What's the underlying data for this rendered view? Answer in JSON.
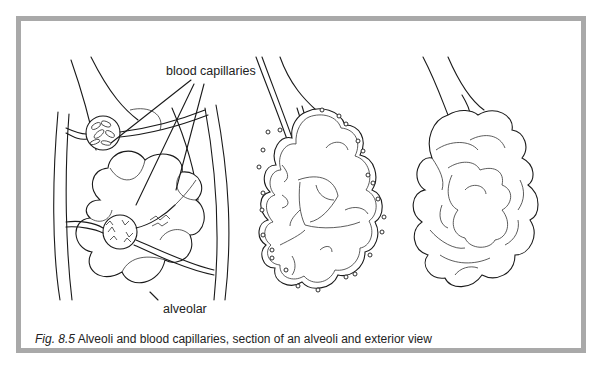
{
  "figure": {
    "number": "Fig. 8.5",
    "caption": "Alveoli and blood capillaries, section of an alveoli and exterior view"
  },
  "labels": {
    "blood_capillaries": "blood capillaries",
    "alveolar": "alveolar"
  },
  "panels": [
    {
      "id": "capillary-network",
      "description": "Alveolar sac wrapped in blood capillaries with leader lines"
    },
    {
      "id": "section-view",
      "description": "Cross-section of an alveolar sac showing internal chambers and surface capillaries"
    },
    {
      "id": "exterior-view",
      "description": "Exterior view of a cluster of alveoli on a bronchiole"
    }
  ],
  "colors": {
    "frame_border": "#a9a9a9",
    "line": "#1a1a1a",
    "background": "#ffffff"
  }
}
